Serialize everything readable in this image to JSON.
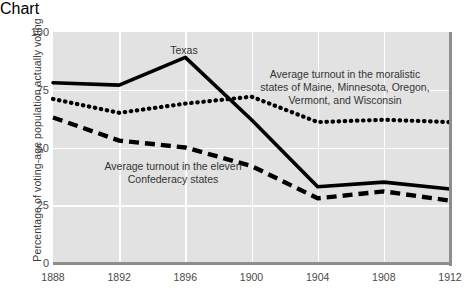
{
  "chart_data": {
    "type": "line",
    "title": "",
    "xlabel": "",
    "ylabel": "Percentage of voting-age population actually voting",
    "x": [
      1888,
      1892,
      1896,
      1900,
      1904,
      1908,
      1912
    ],
    "xtick_labels": [
      "1888",
      "1892",
      "1896",
      "1900",
      "1904",
      "1908",
      "1912"
    ],
    "ytick_labels": [
      "0",
      "25",
      "50",
      "75",
      "100"
    ],
    "yticks": [
      0,
      25,
      50,
      75,
      100
    ],
    "ylim": [
      0,
      100
    ],
    "xlim": [
      1888,
      1912
    ],
    "grid": true,
    "legend_position": "inline-annotations",
    "series": [
      {
        "name": "Texas",
        "style": "solid",
        "color": "#000000",
        "values": [
          78,
          77,
          89,
          62,
          33,
          35,
          32
        ]
      },
      {
        "name": "Average turnout in the moralistic states of Maine, Minnesota, Oregon, Vermont, and Wisconsin",
        "style": "dotted",
        "color": "#000000",
        "values": [
          71,
          65,
          69,
          72,
          61,
          62,
          61
        ]
      },
      {
        "name": "Average turnout in the eleven Confederacy states",
        "style": "dashed",
        "color": "#000000",
        "values": [
          63,
          53,
          50,
          42,
          28,
          31,
          27
        ]
      }
    ],
    "annotations": [
      {
        "id": "texas",
        "text": "Texas"
      },
      {
        "id": "moralistic",
        "line1": "Average turnout in the moralistic",
        "line2": "states of Maine, Minnesota, Oregon,",
        "line3": "Vermont, and Wisconsin"
      },
      {
        "id": "confederacy",
        "line1": "Average turnout in the eleven",
        "line2": "Confederacy states"
      }
    ],
    "colors": {
      "plot_background": "#e2e2e2",
      "page_background": "#ffffff",
      "gridline": "#fdfdfd",
      "axis_edge": "#8d8d8d",
      "series_line": "#000000",
      "tick_text": "#4a4a4a",
      "annotation_text": "#333333"
    }
  }
}
